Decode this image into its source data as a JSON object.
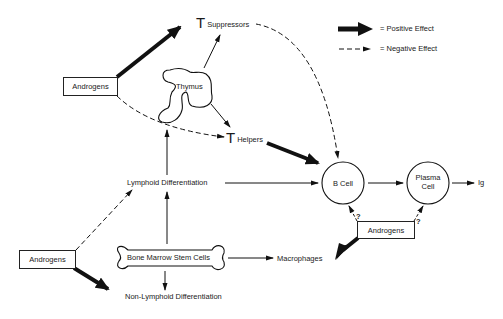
{
  "diagram": {
    "legend": {
      "positive": "= Positive Effect",
      "negative": "= Negative Effect"
    },
    "nodes": {
      "androgens_top": "Androgens",
      "androgens_right": "Androgens",
      "androgens_bottom": "Androgens",
      "t_suppressors_T": "T",
      "t_suppressors": "Suppressors",
      "t_helpers_T": "T",
      "t_helpers": "Helpers",
      "thymus": "Thymus",
      "b_cell": "B Cell",
      "plasma_cell_line1": "Plasma",
      "plasma_cell_line2": "Cell",
      "ig": "Ig",
      "lymphoid": "Lymphoid Differentiation",
      "non_lymphoid": "Non-Lymphoid Differentiation",
      "bone_marrow": "Bone Marrow Stem Cells",
      "macrophages": "Macrophages",
      "question_left": "?",
      "question_right": "?"
    },
    "edges": [
      {
        "from": "Androgens (top)",
        "to": "T Suppressors",
        "type": "positive"
      },
      {
        "from": "Androgens (top)",
        "to": "T Helpers",
        "type": "negative"
      },
      {
        "from": "Thymus",
        "to": "T Suppressors",
        "type": "normal"
      },
      {
        "from": "Thymus",
        "to": "T Helpers",
        "type": "normal"
      },
      {
        "from": "T Suppressors",
        "to": "B Cell",
        "type": "negative"
      },
      {
        "from": "T Helpers",
        "to": "B Cell",
        "type": "positive"
      },
      {
        "from": "Lymphoid Differentiation",
        "to": "Thymus",
        "type": "normal"
      },
      {
        "from": "Lymphoid Differentiation",
        "to": "B Cell",
        "type": "normal"
      },
      {
        "from": "B Cell",
        "to": "Plasma Cell",
        "type": "normal"
      },
      {
        "from": "Plasma Cell",
        "to": "Ig",
        "type": "normal"
      },
      {
        "from": "Androgens (right)",
        "to": "B Cell",
        "type": "negative",
        "uncertain": true
      },
      {
        "from": "Androgens (right)",
        "to": "Plasma Cell",
        "type": "negative",
        "uncertain": true
      },
      {
        "from": "Androgens (right)",
        "to": "Macrophages",
        "type": "positive"
      },
      {
        "from": "Bone Marrow Stem Cells",
        "to": "Lymphoid Differentiation",
        "type": "normal"
      },
      {
        "from": "Bone Marrow Stem Cells",
        "to": "Non-Lymphoid Differentiation",
        "type": "normal"
      },
      {
        "from": "Bone Marrow Stem Cells",
        "to": "Macrophages",
        "type": "normal"
      },
      {
        "from": "Androgens (bottom)",
        "to": "Lymphoid Differentiation",
        "type": "negative"
      },
      {
        "from": "Androgens (bottom)",
        "to": "Non-Lymphoid Differentiation",
        "type": "positive"
      }
    ]
  }
}
